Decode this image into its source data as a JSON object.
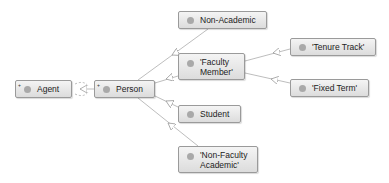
{
  "diagram": {
    "nodes": [
      {
        "id": "agent",
        "label": "Agent",
        "expandable": true
      },
      {
        "id": "person",
        "label": "Person",
        "expandable": true
      },
      {
        "id": "non_academic",
        "label": "Non-Academic"
      },
      {
        "id": "faculty_member",
        "label": "'Faculty Member'"
      },
      {
        "id": "tenure_track",
        "label": "'Tenure Track'"
      },
      {
        "id": "fixed_term",
        "label": "'Fixed Term'"
      },
      {
        "id": "student",
        "label": "Student"
      },
      {
        "id": "non_faculty_academic",
        "label": "'Non-Faculty Academic'"
      }
    ],
    "edges": [
      {
        "from": "person",
        "to": "agent",
        "type": "subclass"
      },
      {
        "from": "non_academic",
        "to": "person",
        "type": "subclass"
      },
      {
        "from": "faculty_member",
        "to": "person",
        "type": "subclass"
      },
      {
        "from": "student",
        "to": "person",
        "type": "subclass"
      },
      {
        "from": "non_faculty_academic",
        "to": "person",
        "type": "subclass"
      },
      {
        "from": "tenure_track",
        "to": "faculty_member",
        "type": "subclass"
      },
      {
        "from": "fixed_term",
        "to": "faculty_member",
        "type": "subclass"
      }
    ],
    "expand_glyph": "+",
    "colors": {
      "edge": "#b5b5b5",
      "node_border": "#9a9a9a",
      "dot": "#a9a9a9"
    }
  }
}
